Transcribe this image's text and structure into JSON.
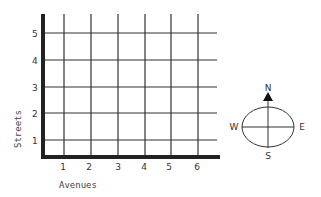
{
  "grid": {
    "y_axis_label": "Streets",
    "x_axis_label": "Avenues",
    "x_ticks": [
      "1",
      "2",
      "3",
      "4",
      "5",
      "6"
    ],
    "y_ticks": [
      "1",
      "2",
      "3",
      "4",
      "5"
    ]
  },
  "compass": {
    "north": "N",
    "south": "S",
    "east": "E",
    "west": "W"
  }
}
